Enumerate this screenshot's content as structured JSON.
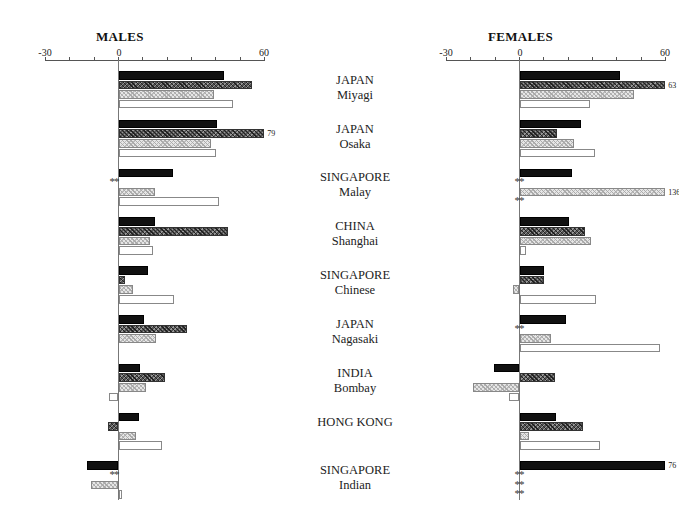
{
  "chart_data": [
    {
      "type": "bar",
      "orientation": "horizontal",
      "title": "MALES",
      "xlim": [
        -30,
        60
      ],
      "xticks": [
        -30,
        0,
        60
      ],
      "grid": false,
      "categories": [
        "JAPAN Miyagi",
        "JAPAN Osaka",
        "SINGAPORE Malay",
        "CHINA Shanghai",
        "SINGAPORE Chinese",
        "JAPAN Nagasaki",
        "INDIA Bombay",
        "HONG KONG",
        "SINGAPORE Indian"
      ],
      "series": [
        {
          "name": "black",
          "values": [
            43.5,
            40.5,
            22.5,
            15,
            12,
            10.5,
            9,
            8.5,
            -13
          ]
        },
        {
          "name": "dark-hatched",
          "values": [
            55,
            79,
            null,
            45,
            2.5,
            28,
            19,
            -4.5,
            null
          ]
        },
        {
          "name": "light-stippled",
          "values": [
            39.5,
            38,
            15,
            13,
            6,
            15.5,
            11.5,
            7,
            -11.5
          ]
        },
        {
          "name": "white",
          "values": [
            47,
            40,
            41.5,
            14,
            23,
            0,
            -4,
            18,
            1.5
          ]
        }
      ],
      "annotations": [
        {
          "category": "JAPAN Osaka",
          "series": "dark-hatched",
          "text": "79"
        },
        {
          "category": "SINGAPORE Malay",
          "series": "dark-hatched",
          "text": "**"
        },
        {
          "category": "SINGAPORE Indian",
          "series": "dark-hatched",
          "text": "**"
        }
      ]
    },
    {
      "type": "bar",
      "orientation": "horizontal",
      "title": "FEMALES",
      "xlim": [
        -30,
        60
      ],
      "xticks": [
        -30,
        0,
        60
      ],
      "grid": false,
      "categories": [
        "JAPAN Miyagi",
        "JAPAN Osaka",
        "SINGAPORE Malay",
        "CHINA Shanghai",
        "SINGAPORE Chinese",
        "JAPAN Nagasaki",
        "INDIA Bombay",
        "HONG KONG",
        "SINGAPORE Indian"
      ],
      "series": [
        {
          "name": "black",
          "values": [
            41.5,
            25.5,
            21.5,
            20.5,
            10,
            19,
            -10.5,
            15,
            76
          ]
        },
        {
          "name": "dark-hatched",
          "values": [
            63,
            15.5,
            null,
            27,
            10,
            null,
            14.5,
            26,
            null
          ]
        },
        {
          "name": "light-stippled",
          "values": [
            47,
            22.5,
            136,
            29.5,
            -2.5,
            13,
            -19,
            4,
            null
          ]
        },
        {
          "name": "white",
          "values": [
            29,
            31,
            null,
            2.5,
            31.5,
            58,
            -4.5,
            33,
            null
          ]
        }
      ],
      "annotations": [
        {
          "category": "JAPAN Miyagi",
          "series": "dark-hatched",
          "text": "63"
        },
        {
          "category": "SINGAPORE Malay",
          "series": "light-stippled",
          "text": "136"
        },
        {
          "category": "SINGAPORE Malay",
          "series": "dark-hatched",
          "text": "**"
        },
        {
          "category": "SINGAPORE Malay",
          "series": "white",
          "text": "**"
        },
        {
          "category": "JAPAN Nagasaki",
          "series": "dark-hatched",
          "text": "**"
        },
        {
          "category": "SINGAPORE Indian",
          "series": "black",
          "text": "76"
        },
        {
          "category": "SINGAPORE Indian",
          "series": "dark-hatched",
          "text": "**"
        },
        {
          "category": "SINGAPORE Indian",
          "series": "light-stippled",
          "text": "**"
        },
        {
          "category": "SINGAPORE Indian",
          "series": "white",
          "text": "**"
        }
      ]
    }
  ],
  "panels": {
    "males": {
      "title": "MALES",
      "tick_min": "-30",
      "tick_zero": "0",
      "tick_max": "60"
    },
    "females": {
      "title": "FEMALES",
      "tick_min": "-30",
      "tick_zero": "0",
      "tick_max": "60"
    }
  },
  "groups": [
    {
      "line1": "JAPAN",
      "line2": "Miyagi"
    },
    {
      "line1": "JAPAN",
      "line2": "Osaka"
    },
    {
      "line1": "SINGAPORE",
      "line2": "Malay"
    },
    {
      "line1": "CHINA",
      "line2": "Shanghai"
    },
    {
      "line1": "SINGAPORE",
      "line2": "Chinese"
    },
    {
      "line1": "JAPAN",
      "line2": "Nagasaki"
    },
    {
      "line1": "INDIA",
      "line2": "Bombay"
    },
    {
      "line1": "HONG KONG",
      "line2": ""
    },
    {
      "line1": "SINGAPORE",
      "line2": "Indian"
    }
  ],
  "missing_marker": "**"
}
